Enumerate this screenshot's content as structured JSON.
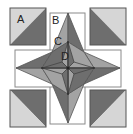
{
  "diagram": {
    "type": "quilt-block",
    "labels": {
      "a": "A",
      "b": "B",
      "c": "C",
      "d": "D"
    },
    "colors": {
      "background": "#ffffff",
      "light": "#d6d6d6",
      "medium": "#a3a3a3",
      "dark": "#6e6e6e",
      "outline": "#555555",
      "frame": "#8a8a8a"
    }
  }
}
